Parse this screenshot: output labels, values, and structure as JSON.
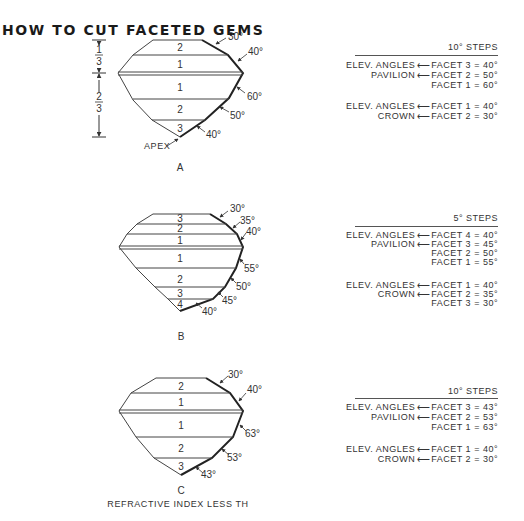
{
  "title": "HOW TO CUT FACETED GEMS",
  "gems": [
    {
      "id": "A",
      "label": "A",
      "crown_facets": [
        "2",
        "1"
      ],
      "pavilion_facets": [
        "1",
        "2",
        "3"
      ],
      "crown_angles": [
        "30°",
        "40°"
      ],
      "pavilion_angles": [
        "60°",
        "50°",
        "40°"
      ],
      "apex_label": "APEX",
      "proportion_top": {
        "num": "1",
        "den": "3"
      },
      "proportion_bottom": {
        "num": "2",
        "den": "3"
      }
    },
    {
      "id": "B",
      "label": "B",
      "crown_facets": [
        "3",
        "2",
        "1"
      ],
      "pavilion_facets": [
        "1",
        "2",
        "3",
        "4"
      ],
      "crown_angles": [
        "30°",
        "35°",
        "40°"
      ],
      "pavilion_angles": [
        "55°",
        "50°",
        "45°",
        "40°"
      ]
    },
    {
      "id": "C",
      "label": "C",
      "crown_facets": [
        "2",
        "1"
      ],
      "pavilion_facets": [
        "1",
        "2",
        "3"
      ],
      "crown_angles": [
        "30°",
        "40°"
      ],
      "pavilion_angles": [
        "63°",
        "53°",
        "43°"
      ],
      "caption": "REFRACTIVE INDEX LESS TH"
    }
  ],
  "tables": [
    {
      "header": "10° STEPS",
      "pavilion": {
        "label_line1": "ELEV. ANGLES",
        "label_line2": "PAVILION",
        "rows": [
          "FACET 3 = 40°",
          "FACET 2 = 50°",
          "FACET 1 = 60°"
        ]
      },
      "crown": {
        "label_line1": "ELEV. ANGLES",
        "label_line2": "CROWN",
        "rows": [
          "FACET 1 = 40°",
          "FACET 2 = 30°"
        ]
      }
    },
    {
      "header": "5° STEPS",
      "pavilion": {
        "label_line1": "ELEV. ANGLES",
        "label_line2": "PAVILION",
        "rows": [
          "FACET 4 = 40°",
          "FACET 3 = 45°",
          "FACET 2 = 50°",
          "FACET 1 = 55°"
        ]
      },
      "crown": {
        "label_line1": "ELEV. ANGLES",
        "label_line2": "CROWN",
        "rows": [
          "FACET 1 = 40°",
          "FACET 2 = 35°",
          "FACET 3 = 30°"
        ]
      }
    },
    {
      "header": "10° STEPS",
      "pavilion": {
        "label_line1": "ELEV. ANGLES",
        "label_line2": "PAVILION",
        "rows": [
          "FACET 3 = 43°",
          "FACET 2 = 53°",
          "FACET 1 = 63°"
        ]
      },
      "crown": {
        "label_line1": "ELEV. ANGLES",
        "label_line2": "CROWN",
        "rows": [
          "FACET 1 = 40°",
          "FACET 2 = 30°"
        ]
      }
    }
  ],
  "arrow_glyph": "⟵"
}
